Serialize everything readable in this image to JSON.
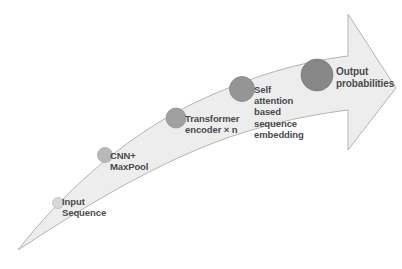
{
  "diagram": {
    "type": "flow-arrow",
    "background_color": "#ffffff",
    "arrow": {
      "name": "curved-pipeline-arrow",
      "fill_color": "#ededed",
      "stroke_color": "#b4b4b4",
      "direction": "left-to-right-upward"
    },
    "label_color": "#4a4a4c",
    "stages": [
      {
        "id": "input-sequence",
        "label": "Input\nSequence",
        "node_color": "#d8d8d8",
        "node_radius": 5.5,
        "cx": 58,
        "cy": 203
      },
      {
        "id": "cnn-maxpool",
        "label": "CNN+\nMaxPool",
        "node_color": "#b9b9b9",
        "node_radius": 7.5,
        "cx": 105,
        "cy": 155
      },
      {
        "id": "transformer-encoder",
        "label": "Transformer\nencoder × n",
        "node_color": "#a0a0a0",
        "node_radius": 10,
        "cx": 176,
        "cy": 118
      },
      {
        "id": "self-attention-embedding",
        "label": "Self\nattention\nbased\nsequence\nembedding",
        "node_color": "#959595",
        "node_radius": 12.5,
        "cx": 242,
        "cy": 89
      },
      {
        "id": "output-probabilities",
        "label": "Output\nprobabilities",
        "node_color": "#878787",
        "node_radius": 16,
        "cx": 317,
        "cy": 75
      }
    ]
  }
}
